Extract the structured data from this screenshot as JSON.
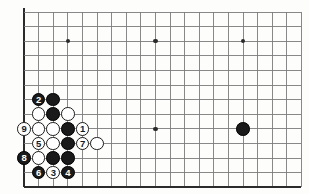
{
  "diagram": {
    "board": {
      "columns": 20,
      "rows": 13,
      "origin_x": 24,
      "origin_y": 12,
      "spacing": 14.6,
      "line_color": "#7b7b7b",
      "edge_color": "#2b2b2b",
      "background_color": "#fdfdfb"
    },
    "star_points": [
      {
        "col": 3,
        "row": 2,
        "name": "star-point-upper-left"
      },
      {
        "col": 9,
        "row": 2,
        "name": "star-point-upper-center"
      },
      {
        "col": 15,
        "row": 2,
        "name": "star-point-upper-right"
      },
      {
        "col": 9,
        "row": 8,
        "name": "star-point-lower-center"
      }
    ],
    "stones": [
      {
        "col": 15,
        "row": 8,
        "color": "black",
        "label": "",
        "name": "stone-black-right-side"
      },
      {
        "col": 1,
        "row": 6,
        "color": "black",
        "label": "2",
        "name": "stone-black-move-2"
      },
      {
        "col": 2,
        "row": 6,
        "color": "black",
        "label": "",
        "name": "stone-black-c6"
      },
      {
        "col": 1,
        "row": 7,
        "color": "white",
        "label": "",
        "name": "stone-white-b7"
      },
      {
        "col": 2,
        "row": 7,
        "color": "black",
        "label": "",
        "name": "stone-black-c7"
      },
      {
        "col": 3,
        "row": 7,
        "color": "white",
        "label": "",
        "name": "stone-white-d7"
      },
      {
        "col": 0,
        "row": 8,
        "color": "white",
        "label": "9",
        "name": "stone-white-move-9"
      },
      {
        "col": 1,
        "row": 8,
        "color": "white",
        "label": "",
        "name": "stone-white-b8"
      },
      {
        "col": 2,
        "row": 8,
        "color": "white",
        "label": "",
        "name": "stone-white-c8"
      },
      {
        "col": 3,
        "row": 8,
        "color": "black",
        "label": "",
        "name": "stone-black-d8"
      },
      {
        "col": 4,
        "row": 8,
        "color": "white",
        "label": "1",
        "name": "stone-white-move-1"
      },
      {
        "col": 1,
        "row": 9,
        "color": "white",
        "label": "5",
        "name": "stone-white-move-5"
      },
      {
        "col": 2,
        "row": 9,
        "color": "white",
        "label": "",
        "name": "stone-white-c9"
      },
      {
        "col": 3,
        "row": 9,
        "color": "black",
        "label": "",
        "name": "stone-black-d9"
      },
      {
        "col": 4,
        "row": 9,
        "color": "white",
        "label": "7",
        "name": "stone-white-move-7"
      },
      {
        "col": 5,
        "row": 9,
        "color": "white",
        "label": "",
        "name": "stone-white-f9"
      },
      {
        "col": 0,
        "row": 10,
        "color": "black",
        "label": "8",
        "name": "stone-black-move-8"
      },
      {
        "col": 1,
        "row": 10,
        "color": "white",
        "label": "",
        "name": "stone-white-b10"
      },
      {
        "col": 2,
        "row": 10,
        "color": "black",
        "label": "",
        "name": "stone-black-c10"
      },
      {
        "col": 3,
        "row": 10,
        "color": "black",
        "label": "",
        "name": "stone-black-d10"
      },
      {
        "col": 1,
        "row": 11,
        "color": "black",
        "label": "6",
        "name": "stone-black-move-6"
      },
      {
        "col": 2,
        "row": 11,
        "color": "white",
        "label": "3",
        "name": "stone-white-move-3"
      },
      {
        "col": 3,
        "row": 11,
        "color": "black",
        "label": "4",
        "name": "stone-black-move-4"
      }
    ]
  }
}
